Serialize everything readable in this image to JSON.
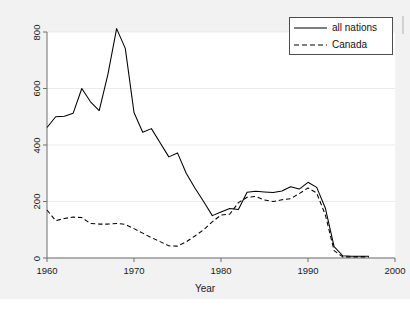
{
  "chart_data": {
    "type": "line",
    "title": "",
    "subtitle": "",
    "xlabel": "Year",
    "ylabel": "",
    "xlim": [
      1960,
      2000
    ],
    "ylim": [
      0,
      800
    ],
    "xticks": [
      1960,
      1970,
      1980,
      1990,
      2000
    ],
    "yticks": [
      0,
      200,
      400,
      600,
      800
    ],
    "xtick_labels": [
      "1960",
      "1970",
      "1980",
      "1990",
      "2000"
    ],
    "ytick_labels": [
      "0",
      "200",
      "400",
      "600",
      "800"
    ],
    "grid": true,
    "grid_axis": "y",
    "legend_position": "top-right",
    "x": [
      1960,
      1961,
      1962,
      1963,
      1964,
      1965,
      1966,
      1967,
      1968,
      1969,
      1970,
      1971,
      1972,
      1973,
      1974,
      1975,
      1976,
      1977,
      1978,
      1979,
      1980,
      1981,
      1982,
      1983,
      1984,
      1985,
      1986,
      1987,
      1988,
      1989,
      1990,
      1991,
      1992,
      1993,
      1994,
      1995,
      1996,
      1997
    ],
    "series": [
      {
        "name": "all nations",
        "style": "solid",
        "color": "#000000",
        "values": [
          462,
          500,
          502,
          512,
          600,
          553,
          522,
          650,
          812,
          742,
          515,
          445,
          458,
          408,
          358,
          372,
          300,
          248,
          200,
          150,
          163,
          175,
          172,
          233,
          236,
          234,
          232,
          237,
          252,
          244,
          268,
          250,
          176,
          40,
          8,
          6,
          6,
          6
        ]
      },
      {
        "name": "Canada",
        "style": "dashed",
        "color": "#000000",
        "values": [
          170,
          132,
          140,
          145,
          143,
          122,
          120,
          120,
          122,
          119,
          104,
          88,
          72,
          58,
          43,
          42,
          57,
          78,
          100,
          128,
          152,
          155,
          196,
          215,
          218,
          205,
          200,
          206,
          210,
          228,
          248,
          230,
          152,
          26,
          4,
          4,
          4,
          4
        ]
      }
    ]
  },
  "legend": {
    "items": [
      {
        "label": "all nations",
        "style": "solid"
      },
      {
        "label": "Canada",
        "style": "dashed"
      }
    ]
  },
  "axes": {
    "x_title": "Year"
  }
}
